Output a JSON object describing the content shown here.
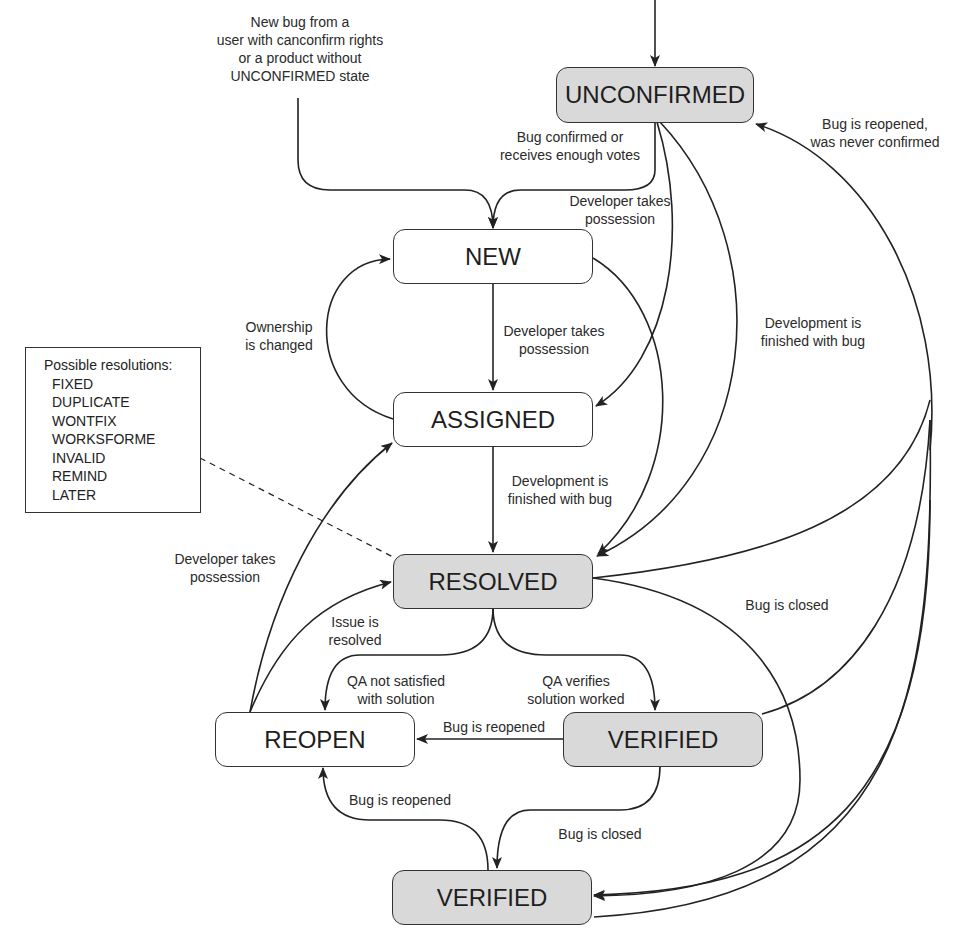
{
  "diagram": {
    "nodes": {
      "unconfirmed": {
        "label": "UNCONFIRMED",
        "fill": "#d9d9d9"
      },
      "new": {
        "label": "NEW",
        "fill": "#ffffff"
      },
      "assigned": {
        "label": "ASSIGNED",
        "fill": "#ffffff"
      },
      "resolved": {
        "label": "RESOLVED",
        "fill": "#d9d9d9"
      },
      "reopen": {
        "label": "REOPEN",
        "fill": "#ffffff"
      },
      "verified": {
        "label": "VERIFIED",
        "fill": "#d9d9d9"
      },
      "closed": {
        "label": "VERIFIED",
        "fill": "#d9d9d9"
      }
    },
    "edge_labels": {
      "entry_new": [
        "New bug from a",
        "user with canconfirm rights",
        "or a product without",
        "UNCONFIRMED state"
      ],
      "unconfirmed_to_new": [
        "Bug confirmed or",
        "receives enough votes"
      ],
      "unconfirmed_to_assigned": [
        "Developer takes",
        "possession"
      ],
      "closed_to_unconfirmed": [
        "Bug is reopened,",
        "was never confirmed"
      ],
      "ownership_changed": [
        "Ownership",
        "is changed"
      ],
      "new_to_assigned": [
        "Developer takes",
        "possession"
      ],
      "unconfirmed_to_resolved": [
        "Development is",
        "finished with bug"
      ],
      "assigned_to_resolved": [
        "Development is",
        "finished with bug"
      ],
      "reopen_to_assigned": [
        "Developer takes",
        "possession"
      ],
      "reopen_to_resolved": [
        "Issue is",
        "resolved"
      ],
      "resolved_to_closed": [
        "Bug is closed"
      ],
      "resolved_to_reopen": [
        "QA not satisfied",
        "with solution"
      ],
      "resolved_to_verified": [
        "QA verifies",
        "solution worked"
      ],
      "verified_to_reopen": [
        "Bug is reopened"
      ],
      "closed_to_reopen": [
        "Bug is reopened"
      ],
      "verified_to_closed": [
        "Bug is closed"
      ]
    },
    "resolutions": {
      "title": "Possible resolutions:",
      "items": [
        "FIXED",
        "DUPLICATE",
        "WONTFIX",
        "WORKSFORME",
        "INVALID",
        "REMIND",
        "LATER"
      ]
    }
  }
}
